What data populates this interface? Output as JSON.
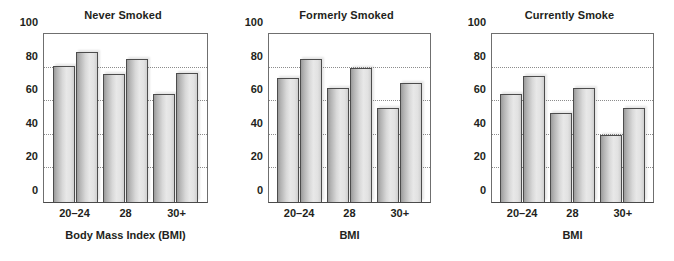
{
  "chart_data": [
    {
      "type": "bar",
      "title": "Never Smoked",
      "xlabel": "Body Mass Index (BMI)",
      "ylabel": "",
      "categories": [
        "20–24",
        "28",
        "30+"
      ],
      "series": [
        {
          "name": "bar-1",
          "values": [
            81,
            76,
            64
          ]
        },
        {
          "name": "bar-2",
          "values": [
            89,
            85,
            77
          ]
        }
      ],
      "ylim": [
        0,
        100
      ],
      "yticks": [
        0,
        20,
        40,
        60,
        80,
        100
      ],
      "ytick_labels": [
        "0",
        "20",
        "40",
        "60",
        "80",
        "100"
      ],
      "gridlines": [
        20,
        40,
        60,
        80
      ],
      "grid": true,
      "legend": "none"
    },
    {
      "type": "bar",
      "title": "Formerly Smoked",
      "xlabel": "BMI",
      "ylabel": "",
      "categories": [
        "20–24",
        "28",
        "30+"
      ],
      "series": [
        {
          "name": "bar-1",
          "values": [
            74,
            68,
            56
          ]
        },
        {
          "name": "bar-2",
          "values": [
            85,
            80,
            71
          ]
        }
      ],
      "ylim": [
        0,
        100
      ],
      "yticks": [
        0,
        20,
        40,
        60,
        80,
        100
      ],
      "ytick_labels": [
        "0",
        "20",
        "40",
        "60",
        "80",
        "100"
      ],
      "gridlines": [
        20,
        40,
        60,
        80
      ],
      "grid": true,
      "legend": "none"
    },
    {
      "type": "bar",
      "title": "Currently Smoke",
      "xlabel": "BMI",
      "ylabel": "",
      "categories": [
        "20–24",
        "28",
        "30+"
      ],
      "series": [
        {
          "name": "bar-1",
          "values": [
            64,
            53,
            40
          ]
        },
        {
          "name": "bar-2",
          "values": [
            75,
            68,
            56
          ]
        }
      ],
      "ylim": [
        0,
        100
      ],
      "yticks": [
        0,
        20,
        40,
        60,
        80,
        100
      ],
      "ytick_labels": [
        "0",
        "20",
        "40",
        "60",
        "80",
        "100"
      ],
      "gridlines": [
        20,
        40,
        60,
        80
      ],
      "grid": true,
      "legend": "none"
    }
  ],
  "figure": {
    "background_color": "#ffffff",
    "axis_color": "#6f6f6f",
    "grid_color": "#8c8c8c",
    "bar_outline_color": "#4c4c4c",
    "bar_fill_light": "#e8e8e8",
    "bar_fill_dark": "#9b9b9b",
    "text_color": "#231f20",
    "panel_count": 3
  }
}
